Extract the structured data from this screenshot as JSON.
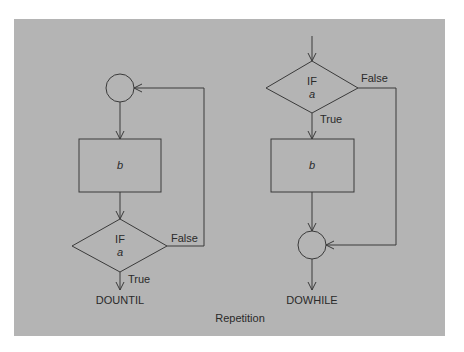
{
  "figure": {
    "caption": "Repetition",
    "background_color": "#b4b4b4",
    "line_color": "#3a3a3a"
  },
  "dountil": {
    "title": "DOUNTIL",
    "process_label": "b",
    "decision_keyword": "IF",
    "decision_condition": "a",
    "true_label": "True",
    "false_label": "False"
  },
  "dowhile": {
    "title": "DOWHILE",
    "process_label": "b",
    "decision_keyword": "IF",
    "decision_condition": "a",
    "true_label": "True",
    "false_label": "False"
  }
}
